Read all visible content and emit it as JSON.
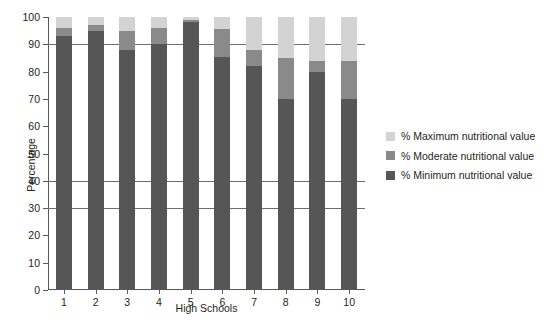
{
  "chart_data": {
    "type": "bar",
    "subtype": "stacked-bar-vertical",
    "title": "",
    "xlabel": "High Schools",
    "ylabel": "Percentage",
    "categories": [
      "1",
      "2",
      "3",
      "4",
      "5",
      "6",
      "7",
      "8",
      "9",
      "10"
    ],
    "ylim": [
      0,
      100
    ],
    "ytick_step": 10,
    "yticks": [
      "0",
      "10",
      "20",
      "30",
      "40",
      "50",
      "60",
      "70",
      "80",
      "90",
      "100"
    ],
    "gridlines": [
      30,
      40,
      90
    ],
    "grid": true,
    "legend_position": "right",
    "series": [
      {
        "name": "% Minimum nutritional value",
        "color": "#565656",
        "values": [
          93,
          95,
          88,
          90,
          98,
          85.5,
          82,
          70,
          80,
          70
        ]
      },
      {
        "name": "% Moderate nutritional value",
        "color": "#8a8a8a",
        "values": [
          3,
          2,
          7,
          6,
          1,
          10,
          6,
          15,
          4,
          14
        ]
      },
      {
        "name": "% Maximum nutritional value",
        "color": "#d3d3d3",
        "values": [
          4,
          3,
          5,
          4,
          1,
          4.5,
          12,
          15,
          16,
          16
        ]
      }
    ]
  },
  "legend": {
    "items": [
      {
        "label": "% Maximum nutritional value",
        "color": "#d3d3d3"
      },
      {
        "label": "% Moderate nutritional value",
        "color": "#8a8a8a"
      },
      {
        "label": "% Minimum nutritional value",
        "color": "#565656"
      }
    ]
  },
  "colors": {
    "maximum": "#d3d3d3",
    "moderate": "#8a8a8a",
    "minimum": "#565656",
    "axis": "#58595b",
    "grid": "#6d6e71",
    "text": "#231f20",
    "background": "#ffffff"
  }
}
